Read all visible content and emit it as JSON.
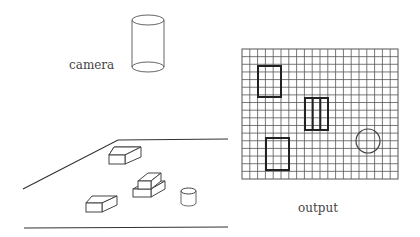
{
  "labels": {
    "camera": "camera",
    "output": "output"
  },
  "output_grid": {
    "columns": 20,
    "rows": 17,
    "objects": [
      {
        "type": "rectangle",
        "label": "box-a"
      },
      {
        "type": "striped-rectangle",
        "label": "stacked-boxes"
      },
      {
        "type": "rectangle",
        "label": "box-b"
      },
      {
        "type": "circle",
        "label": "cylinder"
      }
    ]
  },
  "scene": {
    "objects": [
      "box",
      "stacked-boxes",
      "box",
      "cylinder"
    ]
  }
}
